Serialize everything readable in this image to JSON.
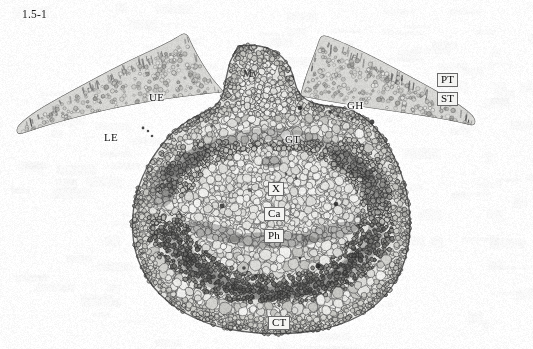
{
  "figure": {
    "caption": "1.5-1",
    "background_color": "#fdfdfd",
    "width": 533,
    "height": 349,
    "specimen": "leaf midrib transverse section",
    "render_mode": "grayscale light micrograph"
  },
  "labels": [
    {
      "id": "My",
      "text": "My",
      "x": 243,
      "y": 69,
      "style": "faint",
      "anchor": "midrib-adaxial-parenchyma"
    },
    {
      "id": "UE",
      "text": "UE",
      "x": 149,
      "y": 92,
      "style": "plain",
      "anchor": "upper-epidermis"
    },
    {
      "id": "LE",
      "text": "LE",
      "x": 104,
      "y": 132,
      "style": "plain",
      "anchor": "lower-epidermis"
    },
    {
      "id": "GH",
      "text": "GH",
      "x": 347,
      "y": 100,
      "style": "plain",
      "anchor": "glandular-hair"
    },
    {
      "id": "PT",
      "text": "PT",
      "x": 437,
      "y": 73,
      "style": "boxed",
      "anchor": "palisade-tissue"
    },
    {
      "id": "ST",
      "text": "ST",
      "x": 437,
      "y": 92,
      "style": "boxed",
      "anchor": "spongy-tissue"
    },
    {
      "id": "GT",
      "text": "GT",
      "x": 285,
      "y": 134,
      "style": "plain",
      "anchor": "ground-tissue"
    },
    {
      "id": "X",
      "text": "X",
      "x": 268,
      "y": 182,
      "style": "boxed",
      "anchor": "xylem"
    },
    {
      "id": "Ca",
      "text": "Ca",
      "x": 264,
      "y": 207,
      "style": "boxed",
      "anchor": "cambium"
    },
    {
      "id": "Ph",
      "text": "Ph",
      "x": 264,
      "y": 229,
      "style": "boxed",
      "anchor": "phloem"
    },
    {
      "id": "CT",
      "text": "CT",
      "x": 268,
      "y": 316,
      "style": "boxed",
      "anchor": "collenchyma-tissue"
    }
  ],
  "palette": {
    "background": "#fdfdfd",
    "cell_wall": "#4a4a4a",
    "cell_lumen_light": "#e8e8e6",
    "cell_lumen_mid": "#d2d2cf",
    "cell_lumen_dark": "#b4b4b0",
    "vascular_dark": "#3c3c3c",
    "epidermis_dark": "#575757",
    "palisade": "#6a6a6a",
    "label_text": "#101010",
    "label_box_fill": "#f4f4f2",
    "label_box_border": "#6b6b6b",
    "caption_text": "#1a1a1a"
  },
  "structure": {
    "midrib_outline": "bulbous lower midrib with domed adaxial ridge, spanning x 120-415, y 45-335",
    "left_blade": "lamina wing sloping up-left from midrib to x 18, y 33",
    "right_blade": "lamina wing sloping up-right from midrib to x 520, y 35",
    "vascular_arc": "crescent bundle ring centred near x 272, y 205 opening upward"
  }
}
